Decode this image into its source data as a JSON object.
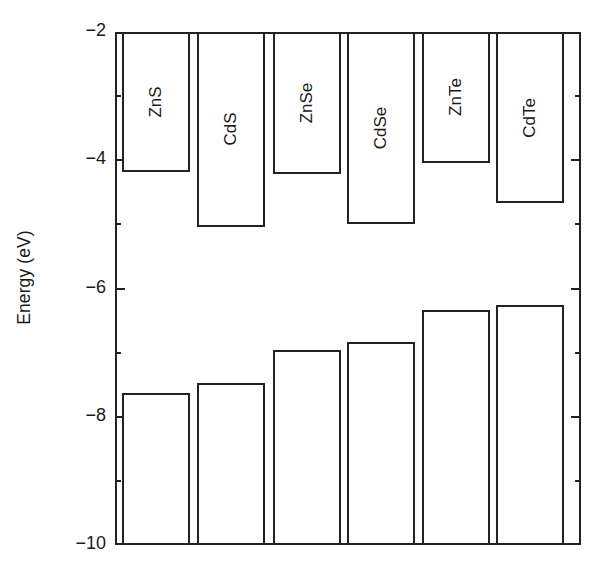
{
  "figure": {
    "axis_title_y": "Energy (eV)",
    "y_tick_labels": [
      "−2",
      "−4",
      "−6",
      "−8",
      "−10"
    ],
    "ink_color": "#222222",
    "background_color": "#ffffff"
  },
  "chart_data": {
    "type": "bar",
    "title": "",
    "xlabel": "",
    "ylabel": "Energy (eV)",
    "ylim": [
      -10,
      -2
    ],
    "y_ticks": [
      -2,
      -4,
      -6,
      -8,
      -10
    ],
    "y_minor_ticks": [
      -3,
      -5,
      -7,
      -9
    ],
    "grid": false,
    "legend": null,
    "categories": [
      "ZnS",
      "CdS",
      "ZnSe",
      "CdSe",
      "ZnTe",
      "CdTe"
    ],
    "series": [
      {
        "name": "Conduction band minimum",
        "values": [
          -4.18,
          -5.04,
          -4.22,
          -5.0,
          -4.04,
          -4.67
        ],
        "bar_top": -2.0,
        "note": "Upper boxes drawn from the top of the axis (-2 eV) down to the conduction band minimum."
      },
      {
        "name": "Valence band maximum",
        "values": [
          -7.63,
          -7.48,
          -6.96,
          -6.84,
          -6.34,
          -6.26
        ],
        "bar_bottom": -10.0,
        "note": "Lower boxes drawn from the valence band maximum down to the bottom of the axis (-10 eV)."
      }
    ],
    "band_gaps": [
      3.45,
      2.44,
      2.74,
      1.84,
      2.3,
      1.59
    ],
    "bars": [
      {
        "label": "ZnS",
        "conduction_band_min": -4.18,
        "valence_band_max": -7.63,
        "band_gap": 3.45
      },
      {
        "label": "CdS",
        "conduction_band_min": -5.04,
        "valence_band_max": -7.48,
        "band_gap": 2.44
      },
      {
        "label": "ZnSe",
        "conduction_band_min": -4.22,
        "valence_band_max": -6.96,
        "band_gap": 2.74
      },
      {
        "label": "CdSe",
        "conduction_band_min": -5.0,
        "valence_band_max": -6.84,
        "band_gap": 1.84
      },
      {
        "label": "ZnTe",
        "conduction_band_min": -4.04,
        "valence_band_max": -6.34,
        "band_gap": 2.3
      },
      {
        "label": "CdTe",
        "conduction_band_min": -4.67,
        "valence_band_max": -6.26,
        "band_gap": 1.59
      }
    ]
  }
}
